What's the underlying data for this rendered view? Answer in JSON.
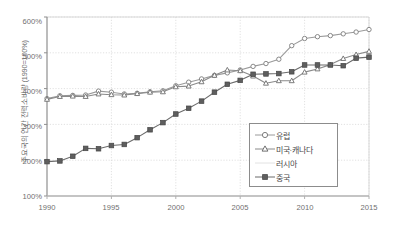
{
  "chart_data": {
    "type": "line",
    "title": "",
    "subtitle": "",
    "xlabel": "",
    "ylabel": "주요국의 연간 전력소비량 (1990=100%)",
    "xlim": [
      1990,
      2015
    ],
    "ylim": [
      100,
      600
    ],
    "grid": true,
    "y_tick_labels": [
      "100%",
      "200%",
      "300%",
      "400%",
      "500%",
      "600%"
    ],
    "y_tick_values": [
      100,
      200,
      300,
      400,
      500,
      600
    ],
    "x_tick_labels": [
      "1990",
      "1995",
      "2000",
      "2005",
      "2010",
      "2015"
    ],
    "x_tick_values": [
      1990,
      1995,
      2000,
      2005,
      2010,
      2015
    ],
    "legend_position": "lower-right",
    "x": [
      1990,
      1991,
      1992,
      1993,
      1994,
      1995,
      1996,
      1997,
      1998,
      1999,
      2000,
      2001,
      2002,
      2003,
      2004,
      2005,
      2006,
      2007,
      2008,
      2009,
      2010,
      2011,
      2012,
      2013,
      2014,
      2015
    ],
    "series": [
      {
        "name": "유럽",
        "marker": "circle-open",
        "color": "#9a9a9a",
        "values": [
          372,
          380,
          381,
          382,
          393,
          390,
          385,
          387,
          391,
          394,
          408,
          418,
          427,
          437,
          444,
          452,
          462,
          470,
          482,
          520,
          540,
          545,
          548,
          553,
          558,
          565
        ]
      },
      {
        "name": "미국·캐나다",
        "marker": "triangle-open",
        "color": "#8a8a8a",
        "values": [
          370,
          378,
          379,
          378,
          385,
          383,
          382,
          386,
          390,
          391,
          405,
          407,
          419,
          437,
          452,
          450,
          435,
          415,
          422,
          422,
          446,
          455,
          467,
          484,
          495,
          504
        ]
      },
      {
        "name": "러시아",
        "marker": "none",
        "color": "#d8d8d8",
        "values": [
          null,
          null,
          null,
          null,
          null,
          null,
          null,
          null,
          null,
          null,
          null,
          null,
          null,
          null,
          null,
          null,
          null,
          null,
          null,
          null,
          null,
          null,
          null,
          null,
          null,
          null
        ]
      },
      {
        "name": "중국",
        "marker": "square-filled",
        "color": "#6b6b6b",
        "values": [
          196,
          198,
          211,
          233,
          232,
          241,
          244,
          263,
          285,
          305,
          329,
          345,
          365,
          390,
          412,
          423,
          440,
          441,
          442,
          447,
          466,
          466,
          466,
          464,
          485,
          488
        ]
      }
    ]
  },
  "legend": {
    "items": [
      {
        "label": "유럽",
        "marker": "circle-open"
      },
      {
        "label": "미국·캐나다",
        "marker": "triangle-open"
      },
      {
        "label": "러시아",
        "marker": "none"
      },
      {
        "label": "중국",
        "marker": "square-filled"
      }
    ]
  }
}
